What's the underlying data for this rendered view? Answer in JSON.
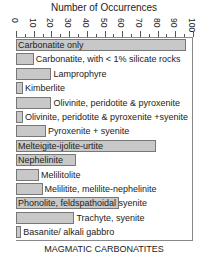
{
  "chart_data": {
    "type": "bar",
    "orientation": "horizontal",
    "title": "Number of Occurrences",
    "xlabel": "MAGMATIC CARBONATITES",
    "ylabel": "",
    "xlim": [
      0,
      100
    ],
    "ticks": [
      "0",
      "10",
      "20",
      "30",
      "40",
      "50",
      "60",
      "70",
      "80",
      "90",
      "100"
    ],
    "grid": false,
    "legend": null,
    "categories": [
      "Carbonatite only",
      "Carbonatite, with < 1% silicate rocks",
      "Lamprophyre",
      "Kimberlite",
      "Olivinite, peridotite & pyroxenite",
      "Olivinite, peridotite & pyroxenite +syenite",
      "Pyroxenite + syenite",
      "Melteigite-ijolite-urtite",
      "Nephelinite",
      "Melilitolite",
      "Melilitite, melilite-nephelinite",
      "Phonolite, feldspathoidal syenite",
      "Trachyte, syenite",
      "Basanite/ alkali gabbro"
    ],
    "values": [
      96,
      10,
      20,
      4,
      20,
      4,
      17,
      79,
      34,
      13,
      15,
      58,
      33,
      3
    ],
    "label_inside": [
      true,
      false,
      false,
      false,
      false,
      false,
      false,
      true,
      true,
      false,
      false,
      true,
      false,
      false
    ],
    "bar_color": "#c8c8c8",
    "bar_edge_color": "#777777"
  }
}
